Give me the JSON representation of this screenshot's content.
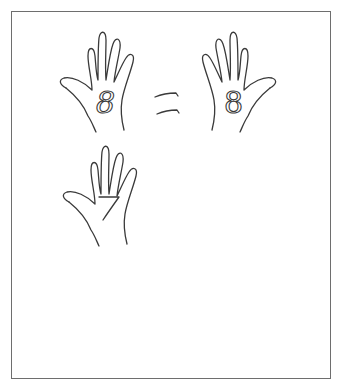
{
  "worksheet": {
    "title": "Finger number comparison",
    "rows": [
      {
        "left_number": "8",
        "symbol": "=",
        "right_number": "8"
      },
      {
        "left_number": "7",
        "symbol": ">",
        "right_number": "6"
      },
      {
        "left_number": "9",
        "symbol": ">",
        "right_number": "6"
      }
    ]
  },
  "colors": {
    "ink": "#3a3a3a",
    "frame": "#6e6e6e",
    "background": "#ffffff"
  }
}
